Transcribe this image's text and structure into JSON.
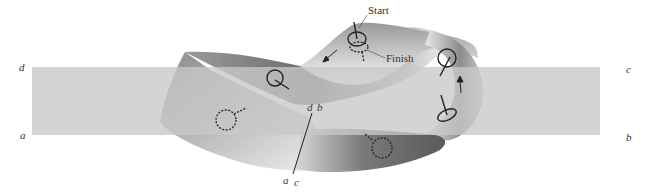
{
  "figure": {
    "type": "mobius-strip-orientation-diagram",
    "annotations": {
      "start": "Start",
      "finish": "Finish"
    },
    "rectangle_corners": {
      "top_left": "d",
      "bottom_left": "a",
      "top_right": "c",
      "bottom_right": "b"
    },
    "seam_labels": {
      "top_left": "d",
      "top_right": "b",
      "bottom_left": "a",
      "bottom_right": "c"
    },
    "colors": {
      "rectangle_fill": "#d4d4d4",
      "band_dark": "#6e6e6e",
      "band_light": "#f2f2f2",
      "ink": "#222222"
    }
  }
}
